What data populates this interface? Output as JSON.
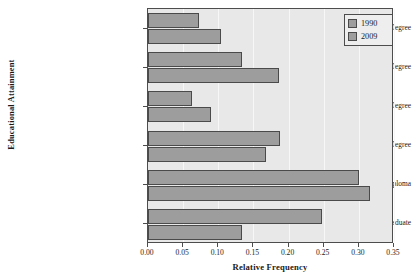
{
  "chart_data": {
    "type": "bar",
    "orientation": "horizontal",
    "title": "",
    "xlabel": "Relative Frequency",
    "ylabel": "Educational Attainment",
    "xlim": [
      0.0,
      0.35
    ],
    "xticks": [
      "0.00",
      "0.05",
      "0.10",
      "0.15",
      "0.20",
      "0.25",
      "0.30",
      "0.35"
    ],
    "xtick_values": [
      0.0,
      0.05,
      0.1,
      0.15,
      0.2,
      0.25,
      0.3,
      0.35
    ],
    "grid": true,
    "grid_axis": "x",
    "legend_position": "top-right",
    "categories": [
      "Graduate or Professional Degree",
      "Bachelor's Degree",
      "Associate's Degree",
      "Some College, No Degree",
      "High School Diploma",
      "Not a High School Graduate"
    ],
    "series": [
      {
        "name": "1990",
        "color": "#9d9d9d",
        "values": [
          0.073,
          0.134,
          0.063,
          0.188,
          0.3,
          0.248
        ]
      },
      {
        "name": "2009",
        "color": "#9d9d9d",
        "values": [
          0.104,
          0.187,
          0.09,
          0.168,
          0.316,
          0.134
        ]
      }
    ]
  },
  "colors": {
    "plot_background": "#e8e8e8",
    "gridline": "#f7f7f7",
    "bar_fill": "#9d9d9d",
    "bar_border": "#4a4a4a",
    "axis": "#4d4d4d",
    "text": "#1a1a1a",
    "legend_background": "#eeeeee"
  },
  "legend": {
    "items": [
      {
        "label": "1990"
      },
      {
        "label": "2009"
      }
    ]
  }
}
